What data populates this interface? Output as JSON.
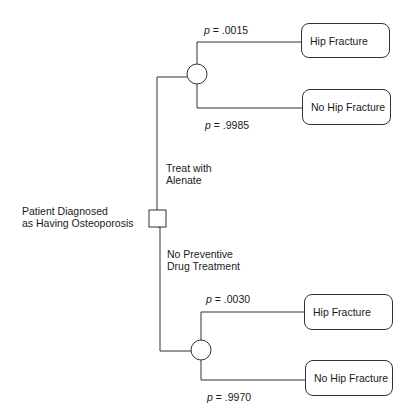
{
  "root": {
    "label_line1": "Patient Diagnosed",
    "label_line2": "as Having Osteoporosis",
    "node_type": "decision-square"
  },
  "branches": [
    {
      "label_line1": "Treat with",
      "label_line2": "Alenate",
      "node_type": "chance-circle",
      "outcomes": [
        {
          "p_prefix": "p",
          "p_value": " = .0015",
          "label": "Hip Fracture"
        },
        {
          "p_prefix": "p",
          "p_value": " = .9985",
          "label": "No Hip Fracture"
        }
      ]
    },
    {
      "label_line1": "No Preventive",
      "label_line2": "Drug Treatment",
      "node_type": "chance-circle",
      "outcomes": [
        {
          "p_prefix": "p",
          "p_value": " = .0030",
          "label": "Hip Fracture"
        },
        {
          "p_prefix": "p",
          "p_value": " = .9970",
          "label": "No Hip Fracture"
        }
      ]
    }
  ]
}
